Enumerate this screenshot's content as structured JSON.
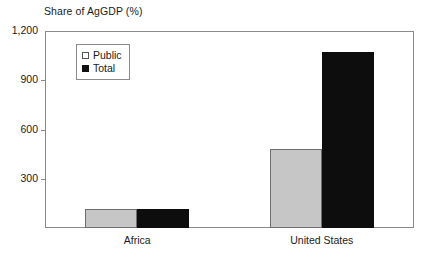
{
  "chart_data": {
    "type": "bar",
    "title": "Share of AgGDP (%)",
    "xlabel": "",
    "ylabel": "",
    "categories": [
      "Africa",
      "United States"
    ],
    "series": [
      {
        "name": "Public",
        "values": [
          115,
          480
        ],
        "color": "#c6c6c6"
      },
      {
        "name": "Total",
        "values": [
          118,
          1075
        ],
        "color": "#0d0d0d"
      }
    ],
    "ylim": [
      0,
      1200
    ],
    "yticks": [
      0,
      300,
      600,
      900,
      1200
    ],
    "ytick_labels": [
      "",
      "300",
      "600",
      "900",
      "1,200"
    ],
    "grid": false,
    "legend_position": "upper left",
    "frame": true
  },
  "axis": {
    "y_ticks": [
      {
        "value": 1200,
        "label": "1,200"
      },
      {
        "value": 900,
        "label": "900"
      },
      {
        "value": 600,
        "label": "600"
      },
      {
        "value": 300,
        "label": "300"
      }
    ]
  },
  "legend": {
    "items": [
      {
        "label": "Public",
        "swatch": "legend-swatch-public"
      },
      {
        "label": "Total",
        "swatch": "legend-swatch-total"
      }
    ]
  },
  "colors": {
    "public": "#c6c6c6",
    "public_border": "#6e6e6e",
    "total": "#0d0d0d",
    "frame": "#8a8a8a",
    "text": "#1a1a1a",
    "background": "#ffffff"
  }
}
